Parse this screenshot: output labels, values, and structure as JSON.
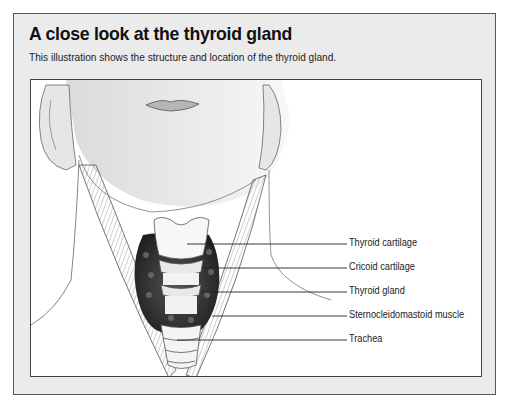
{
  "title": "A close look at the thyroid gland",
  "subtitle": "This illustration shows the structure and location of the thyroid gland.",
  "illustration": {
    "subject": "front view of lower face and neck showing thyroid anatomy",
    "labels": [
      {
        "text": "Thyroid cartilage"
      },
      {
        "text": "Cricoid cartilage"
      },
      {
        "text": "Thyroid gland"
      },
      {
        "text": "Sternocleidomastoid muscle"
      },
      {
        "text": "Trachea"
      }
    ]
  },
  "colors": {
    "panel_background": "#ebebeb",
    "figure_background": "#ffffff",
    "border": "#555555",
    "text": "#111111"
  }
}
